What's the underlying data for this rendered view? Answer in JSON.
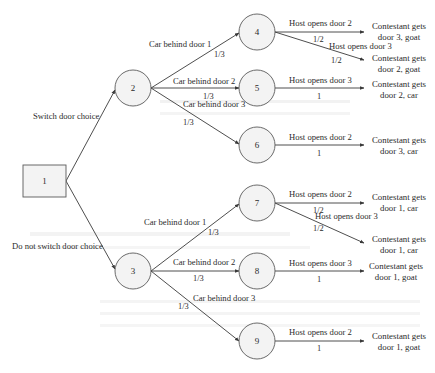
{
  "diagram": {
    "type": "decision-tree",
    "colors": {
      "node_fill": "#f3f3f3",
      "node_stroke": "#5a5a5a",
      "edge": "#3a3a3a",
      "text": "#2b2b2b"
    },
    "nodes": {
      "n1": {
        "label": "1",
        "shape": "square"
      },
      "n2": {
        "label": "2",
        "shape": "circle"
      },
      "n3": {
        "label": "3",
        "shape": "circle"
      },
      "n4": {
        "label": "4",
        "shape": "circle"
      },
      "n5": {
        "label": "5",
        "shape": "circle"
      },
      "n6": {
        "label": "6",
        "shape": "circle"
      },
      "n7": {
        "label": "7",
        "shape": "circle"
      },
      "n8": {
        "label": "8",
        "shape": "circle"
      },
      "n9": {
        "label": "9",
        "shape": "circle"
      }
    },
    "decisions": {
      "switch": "Switch door choice",
      "no_switch": "Do not switch door choice"
    },
    "chance_edges": {
      "e2_4": {
        "label": "Car behind door 1",
        "prob": "1/3"
      },
      "e2_5": {
        "label": "Car behind door 2",
        "prob": "1/3"
      },
      "e2_6": {
        "label": "Car behind door 3",
        "prob": "1/3"
      },
      "e3_7": {
        "label": "Car behind door 1",
        "prob": "1/3"
      },
      "e3_8": {
        "label": "Car behind door 2",
        "prob": "1/3"
      },
      "e3_9": {
        "label": "Car behind door 3",
        "prob": "1/3"
      }
    },
    "host_edges": {
      "e4_a": {
        "label": "Host opens door 2",
        "prob": "1/2"
      },
      "e4_b": {
        "label": "Host opens door 3",
        "prob": "1/2"
      },
      "e5": {
        "label": "Host opens door 3",
        "prob": "1"
      },
      "e6": {
        "label": "Host opens door 2",
        "prob": "1"
      },
      "e7_a": {
        "label": "Host opens door 2",
        "prob": "1/2"
      },
      "e7_b": {
        "label": "Host opens door 3",
        "prob": "1/2"
      },
      "e8": {
        "label": "Host opens door 3",
        "prob": "1"
      },
      "e9": {
        "label": "Host opens door 2",
        "prob": "1"
      }
    },
    "outcomes": {
      "o4a": {
        "line1": "Contestant gets",
        "line2": "door 3, goat"
      },
      "o4b": {
        "line1": "Contestant gets",
        "line2": "door 2, goat"
      },
      "o5": {
        "line1": "Contestant gets",
        "line2": "door 2, car"
      },
      "o6": {
        "line1": "Contestant gets",
        "line2": "door 3, car"
      },
      "o7a": {
        "line1": "Contestant gets",
        "line2": "door 1, car"
      },
      "o7b": {
        "line1": "Contestant gets",
        "line2": "door 1, car"
      },
      "o8": {
        "line1": "Contestant gets",
        "line2": "door 1, goat"
      },
      "o9": {
        "line1": "Contestant gets",
        "line2": "door 1, goat"
      }
    }
  }
}
